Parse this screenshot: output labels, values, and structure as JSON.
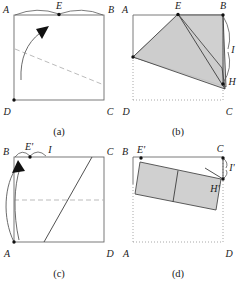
{
  "figure": {
    "panels": [
      {
        "id": "a",
        "caption": "(a)",
        "vertex_labels": [
          {
            "name": "A",
            "text": "A"
          },
          {
            "name": "E",
            "text": "E"
          },
          {
            "name": "B",
            "text": "B"
          },
          {
            "name": "D",
            "text": "D"
          },
          {
            "name": "C",
            "text": "C"
          }
        ],
        "annotation_labels": []
      },
      {
        "id": "b",
        "caption": "(b)",
        "vertex_labels": [
          {
            "name": "A",
            "text": "A"
          },
          {
            "name": "E",
            "text": "E"
          },
          {
            "name": "B",
            "text": "B"
          },
          {
            "name": "H",
            "text": "H"
          },
          {
            "name": "D",
            "text": "D"
          },
          {
            "name": "C",
            "text": "C"
          }
        ],
        "annotation_labels": [
          {
            "name": "I",
            "text": "I"
          }
        ]
      },
      {
        "id": "c",
        "caption": "(c)",
        "vertex_labels": [
          {
            "name": "B",
            "text": "B"
          },
          {
            "name": "Eprime",
            "text": "E'"
          },
          {
            "name": "C",
            "text": "C"
          },
          {
            "name": "A",
            "text": "A"
          },
          {
            "name": "D",
            "text": "D"
          }
        ],
        "annotation_labels": [
          {
            "name": "I",
            "text": "I"
          }
        ]
      },
      {
        "id": "d",
        "caption": "(d)",
        "vertex_labels": [
          {
            "name": "B",
            "text": "B"
          },
          {
            "name": "Eprime",
            "text": "E'"
          },
          {
            "name": "C",
            "text": "C"
          },
          {
            "name": "Hprime",
            "text": "H'"
          },
          {
            "name": "A",
            "text": "A"
          },
          {
            "name": "D",
            "text": "D"
          }
        ],
        "annotation_labels": [
          {
            "name": "Iprime",
            "text": "I'"
          }
        ]
      }
    ],
    "colors": {
      "shading": "#cccccc",
      "outline": "#4a4a4a",
      "construction": "#6b6b6b",
      "dashed": "#b3b3b3",
      "dotted": "#9e9e9e",
      "text": "#1a1a1a"
    }
  }
}
